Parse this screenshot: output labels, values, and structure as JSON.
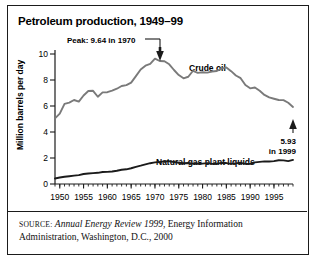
{
  "chart_data": {
    "type": "line",
    "title": "Petroleum production, 1949–99",
    "xlabel": "",
    "ylabel": "Million barrels per day",
    "xlim": [
      1949,
      1999
    ],
    "ylim": [
      0,
      10.8
    ],
    "grid": false,
    "legend_position": "inline-labels",
    "x_ticks": [
      "1950",
      "1955",
      "1960",
      "1965",
      "1970",
      "1975",
      "1980",
      "1985",
      "1990",
      "1995"
    ],
    "x_tick_values": [
      1950,
      1955,
      1960,
      1965,
      1970,
      1975,
      1980,
      1985,
      1990,
      1995
    ],
    "y_ticks": [
      "0",
      "2",
      "4",
      "6",
      "8",
      "10"
    ],
    "y_tick_values": [
      0,
      2,
      4,
      6,
      8,
      10
    ],
    "x": [
      1949,
      1950,
      1951,
      1952,
      1953,
      1954,
      1955,
      1956,
      1957,
      1958,
      1959,
      1960,
      1961,
      1962,
      1963,
      1964,
      1965,
      1966,
      1967,
      1968,
      1969,
      1970,
      1971,
      1972,
      1973,
      1974,
      1975,
      1976,
      1977,
      1978,
      1979,
      1980,
      1981,
      1982,
      1983,
      1984,
      1985,
      1986,
      1987,
      1988,
      1989,
      1990,
      1991,
      1992,
      1993,
      1994,
      1995,
      1996,
      1997,
      1998,
      1999
    ],
    "series": [
      {
        "name": "Crude oil",
        "label": "Crude oil",
        "color": "#7a7a7a",
        "values": [
          5.05,
          5.41,
          6.16,
          6.26,
          6.46,
          6.34,
          6.81,
          7.15,
          7.17,
          6.71,
          7.05,
          7.06,
          7.18,
          7.33,
          7.54,
          7.61,
          7.8,
          8.3,
          8.81,
          9.1,
          9.24,
          9.64,
          9.46,
          9.44,
          9.21,
          8.77,
          8.38,
          8.13,
          8.25,
          8.71,
          8.55,
          8.6,
          8.57,
          8.65,
          8.69,
          8.88,
          8.97,
          8.68,
          8.35,
          8.14,
          7.61,
          7.36,
          7.42,
          7.17,
          6.85,
          6.66,
          6.56,
          6.46,
          6.45,
          6.25,
          5.93
        ]
      },
      {
        "name": "Natural gas plant liquids",
        "label": "Natural gas plant liquids",
        "color": "#1b1b1b",
        "values": [
          0.42,
          0.5,
          0.56,
          0.6,
          0.64,
          0.68,
          0.77,
          0.81,
          0.84,
          0.86,
          0.92,
          0.93,
          0.96,
          1.02,
          1.1,
          1.13,
          1.21,
          1.32,
          1.41,
          1.51,
          1.6,
          1.66,
          1.69,
          1.74,
          1.74,
          1.69,
          1.63,
          1.6,
          1.62,
          1.57,
          1.58,
          1.57,
          1.61,
          1.55,
          1.56,
          1.63,
          1.61,
          1.55,
          1.59,
          1.63,
          1.55,
          1.56,
          1.66,
          1.7,
          1.74,
          1.73,
          1.76,
          1.83,
          1.82,
          1.76,
          1.85
        ]
      }
    ],
    "annotations": [
      {
        "name": "peak",
        "text": "Peak: 9.64 in 1970",
        "x": 1970,
        "y": 9.64
      },
      {
        "name": "end-value",
        "line1": "5.93",
        "line2": "in 1999",
        "x": 1999,
        "y": 5.93
      }
    ]
  },
  "source": {
    "label": "SOURCE:",
    "italic_title": "Annual Energy Review 1999",
    "rest": ", Energy Information Administration, Washington, D.C., 2000"
  }
}
